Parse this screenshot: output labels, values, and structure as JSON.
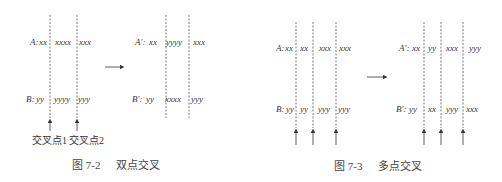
{
  "figures": [
    {
      "id": "fig-7-2",
      "caption_number": "图 7-2",
      "caption_title": "双点交叉",
      "before": {
        "a_label": "A:",
        "a_segments": [
          "xx",
          "xxxx",
          "xxx"
        ],
        "b_label": "B:",
        "b_segments": [
          "yy",
          "yyyy",
          "yyy"
        ]
      },
      "after": {
        "a_label": "A':",
        "a_segments": [
          "xx",
          "yyyy",
          "xxx"
        ],
        "b_label": "B':",
        "b_segments": [
          "yy",
          "xxxx",
          "yyy"
        ]
      },
      "crossover_points": [
        "交叉点1",
        "交叉点2"
      ]
    },
    {
      "id": "fig-7-3",
      "caption_number": "图 7-3",
      "caption_title": "多点交叉",
      "before": {
        "a_label": "A:",
        "a_segments": [
          "xx",
          "xx",
          "xxx",
          "xxx"
        ],
        "b_label": "B:",
        "b_segments": [
          "yy",
          "yy",
          "yyy",
          "yyy"
        ]
      },
      "after": {
        "a_label": "A':",
        "a_segments": [
          "xx",
          "yy",
          "xxx",
          "yyy"
        ],
        "b_label": "B':",
        "b_segments": [
          "yy",
          "xx",
          "yyy",
          "xxx"
        ]
      }
    }
  ]
}
